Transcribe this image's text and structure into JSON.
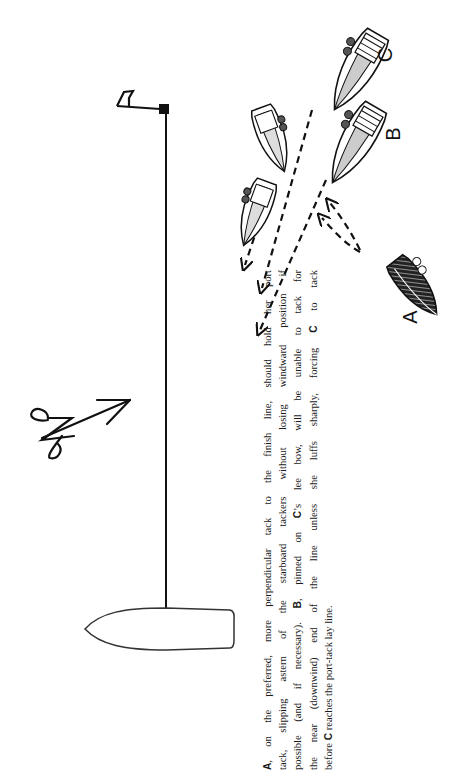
{
  "figure": {
    "type": "sailing-race-finish-diagram",
    "orientation": "rotated 90 degrees counter-clockwise",
    "boats": [
      {
        "label": "A",
        "tack": "port",
        "hull_fill": "crosshatched-dark",
        "role": "preferred tack boat"
      },
      {
        "label": "B",
        "tack": "starboard",
        "hull_fill": "light",
        "role": "pinned on C's lee bow"
      },
      {
        "label": "C",
        "tack": "starboard",
        "hull_fill": "light",
        "role": "windward starboard tacker"
      }
    ],
    "marks": {
      "committee_boat": "committee-boat",
      "pin_mark": "flag-buoy",
      "finish_line": "finish-line"
    },
    "wind_icon": "wind-arrow-icon",
    "caption": {
      "lines": [
        {
          "bold": "A",
          "text": ", on the preferred, more perpendicular tack to the finish line, should hold her port"
        },
        {
          "text": "tack, slipping astern of the starboard tackers without losing windward position if"
        },
        {
          "pre": "possible (and if necessary). ",
          "bold": "B",
          "text": ", pinned on ",
          "bold2": "C",
          "post": "’s lee bow, will be unable to tack for"
        },
        {
          "pre": "the near (downwind) end of the line unless she luffs sharply, forcing ",
          "bold": "C",
          "text": " to tack"
        },
        {
          "pre": "before ",
          "bold": "C",
          "text": " reaches the port-tack lay line."
        }
      ]
    }
  },
  "colors": {
    "ink": "#111111",
    "paper": "#ffffff"
  }
}
